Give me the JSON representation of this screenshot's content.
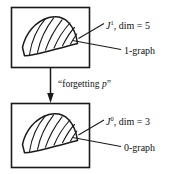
{
  "figure": {
    "background_color": "#ffffff",
    "line_color": "#1a1a1a",
    "text_color": "#111111"
  },
  "top_panel": {
    "name": "1-jet panel",
    "shape_name": "1-graph wedge",
    "labels": {
      "jet_symbol": "J",
      "jet_order": "1",
      "jet_dim_text": ", dim = 5",
      "graph_label": "1-graph"
    }
  },
  "transition": {
    "arrow_label_open_quote": "“",
    "arrow_label_text": "forgetting ",
    "arrow_label_var": "p",
    "arrow_label_close_quote": "”",
    "arrow_direction": "down"
  },
  "bottom_panel": {
    "name": "0-jet panel",
    "shape_name": "0-graph wedge",
    "labels": {
      "jet_symbol": "J",
      "jet_order": "0",
      "jet_dim_text": ", dim = 3",
      "graph_label": "0-graph"
    }
  }
}
